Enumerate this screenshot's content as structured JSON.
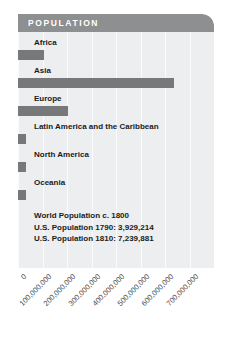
{
  "header": {
    "title": "POPULATION"
  },
  "colors": {
    "header_bar": "#8d8f91",
    "panel_background": "#eceef0",
    "bar": "#76787a",
    "gridline": "#fafbfc",
    "text": "#1b1b1b",
    "axis_text": "#4c4c4c",
    "header_text": "#ffffff"
  },
  "notes": [
    "World Population c. 1800",
    "U.S. Population 1790: 3,929,214",
    "U.S. Population 1810: 7,239,881"
  ],
  "chart_data": {
    "type": "bar",
    "title": "POPULATION",
    "orientation": "horizontal",
    "xlabel": "",
    "ylabel": "",
    "xlim": [
      0,
      800000000
    ],
    "grid": true,
    "legend": false,
    "categories": [
      "Africa",
      "Asia",
      "Europe",
      "Latin America and the Caribbean",
      "North America",
      "Oceania"
    ],
    "values": [
      107000000,
      635000000,
      203000000,
      24000000,
      7000000,
      2000000
    ],
    "tick_labels": [
      "0",
      "100,000,000",
      "200,000,000",
      "300,000,000",
      "400,000,000",
      "500,000,000",
      "600,000,000",
      "700,000,000"
    ],
    "tick_values": [
      0,
      100000000,
      200000000,
      300000000,
      400000000,
      500000000,
      600000000,
      700000000
    ],
    "annotations": [
      "World Population c. 1800",
      "U.S. Population 1790: 3,929,214",
      "U.S. Population 1810: 7,239,881"
    ]
  }
}
